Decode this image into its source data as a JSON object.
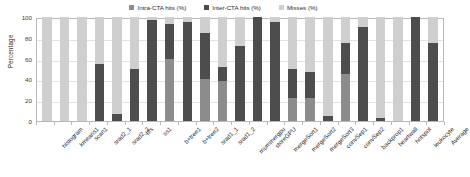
{
  "chart_data": {
    "type": "bar",
    "subtype": "stacked-bar",
    "title": "",
    "xlabel": "",
    "ylabel": "Percentage",
    "ylim": [
      0,
      100
    ],
    "yticks": [
      0,
      20,
      40,
      60,
      80,
      100
    ],
    "grid": true,
    "legend_position": "top-center",
    "categories": [
      "histogram",
      "kmeans1",
      "scan1",
      "srad2_1",
      "srad2_2",
      "bfs",
      "ss1",
      "b+tree1",
      "b+tree2",
      "srad1_1",
      "srad1_2",
      "mummergpu",
      "storeGPU",
      "mergeSort1",
      "mergeSort2",
      "mergeSort3",
      "convSep1",
      "convSep2",
      "backprop1",
      "heartwall",
      "hotspot",
      "leukocyte",
      "Average"
    ],
    "series": [
      {
        "name": "Intra-CTA hits (%)",
        "color": "#8c8c8c",
        "values": [
          0,
          0,
          0,
          0,
          0,
          0,
          0,
          60,
          0,
          40,
          38,
          0,
          0,
          0,
          22,
          22,
          0,
          45,
          0,
          0,
          0,
          0,
          0
        ]
      },
      {
        "name": "Inter-CTA hits (%)",
        "color": "#4d4d4d",
        "values": [
          0,
          0,
          0,
          55,
          7,
          50,
          97,
          33,
          95,
          45,
          14,
          72,
          100,
          95,
          28,
          25,
          5,
          30,
          90,
          3,
          0,
          100,
          75
        ]
      },
      {
        "name": "Misses (%)",
        "color": "#cfcfcf",
        "values": [
          100,
          100,
          100,
          45,
          93,
          50,
          3,
          7,
          5,
          15,
          48,
          28,
          0,
          5,
          50,
          53,
          95,
          25,
          10,
          97,
          100,
          0,
          25
        ]
      }
    ]
  },
  "legend": {
    "items": [
      {
        "label": "Intra-CTA hits (%)",
        "color": "#8c8c8c"
      },
      {
        "label": "Inter-CTA hits (%)",
        "color": "#4d4d4d"
      },
      {
        "label": "Misses (%)",
        "color": "#cfcfcf"
      }
    ]
  },
  "axes": {
    "y_title": "Percentage"
  }
}
